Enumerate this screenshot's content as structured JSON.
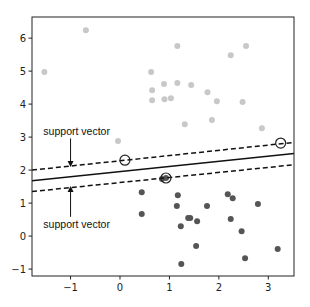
{
  "chart_data": {
    "type": "scatter",
    "title": "",
    "xlabel": "",
    "ylabel": "",
    "xlim": [
      -1.78,
      3.52
    ],
    "ylim": [
      -1.21,
      6.64
    ],
    "grid": false,
    "x_ticks": [
      -1,
      0,
      1,
      2,
      3
    ],
    "x_tick_labels": [
      "−1",
      "0",
      "1",
      "2",
      "3"
    ],
    "y_ticks": [
      -1,
      0,
      1,
      2,
      3,
      4,
      5,
      6
    ],
    "y_tick_labels": [
      "−1",
      "0",
      "1",
      "2",
      "3",
      "4",
      "5",
      "6"
    ],
    "series": [
      {
        "name": "class-upper",
        "color": "#c8c8c8",
        "points": [
          [
            -1.53,
            4.97
          ],
          [
            -0.69,
            6.24
          ],
          [
            1.16,
            5.76
          ],
          [
            2.24,
            5.48
          ],
          [
            2.55,
            5.76
          ],
          [
            0.63,
            4.97
          ],
          [
            0.89,
            4.61
          ],
          [
            1.16,
            4.64
          ],
          [
            1.44,
            4.58
          ],
          [
            1.77,
            4.36
          ],
          [
            1.96,
            4.09
          ],
          [
            0.65,
            4.12
          ],
          [
            1.03,
            4.18
          ],
          [
            2.48,
            4.06
          ],
          [
            1.31,
            3.39
          ],
          [
            1.86,
            3.52
          ],
          [
            2.87,
            3.27
          ],
          [
            -0.04,
            2.88
          ],
          [
            0.65,
            4.42
          ],
          [
            0.9,
            4.15
          ]
        ]
      },
      {
        "name": "class-lower",
        "color": "#555555",
        "points": [
          [
            0.44,
            1.33
          ],
          [
            0.44,
            0.67
          ],
          [
            0.85,
            1.73
          ],
          [
            1.17,
            1.24
          ],
          [
            1.15,
            0.91
          ],
          [
            1.23,
            0.3
          ],
          [
            1.38,
            0.55
          ],
          [
            1.42,
            0.55
          ],
          [
            1.56,
            0.45
          ],
          [
            1.76,
            0.91
          ],
          [
            1.54,
            -0.3
          ],
          [
            2.18,
            1.27
          ],
          [
            2.28,
            1.15
          ],
          [
            2.24,
            0.52
          ],
          [
            2.79,
            0.97
          ],
          [
            2.46,
            0.15
          ],
          [
            2.53,
            -0.67
          ],
          [
            1.24,
            -0.85
          ],
          [
            3.19,
            -0.39
          ],
          [
            0.93,
            1.76
          ]
        ]
      }
    ],
    "support_vectors": [
      [
        0.1,
        2.3
      ],
      [
        0.93,
        1.76
      ],
      [
        3.25,
        2.82
      ]
    ],
    "lines": [
      {
        "name": "decision-boundary",
        "style": "solid",
        "x": [
          -1.78,
          3.52
        ],
        "y": [
          1.68,
          2.5
        ]
      },
      {
        "name": "upper-margin",
        "style": "dashed",
        "x": [
          -1.78,
          3.52
        ],
        "y": [
          2.0,
          2.84
        ]
      },
      {
        "name": "lower-margin",
        "style": "dashed",
        "x": [
          -1.78,
          3.52
        ],
        "y": [
          1.35,
          2.16
        ]
      }
    ],
    "annotations": [
      {
        "text": "support vector",
        "xytext": [
          -1.55,
          3.05
        ],
        "xy": [
          -1.0,
          2.09
        ]
      },
      {
        "text": "support vector",
        "xytext": [
          -1.55,
          0.25
        ],
        "xy": [
          -1.0,
          1.52
        ]
      }
    ]
  }
}
